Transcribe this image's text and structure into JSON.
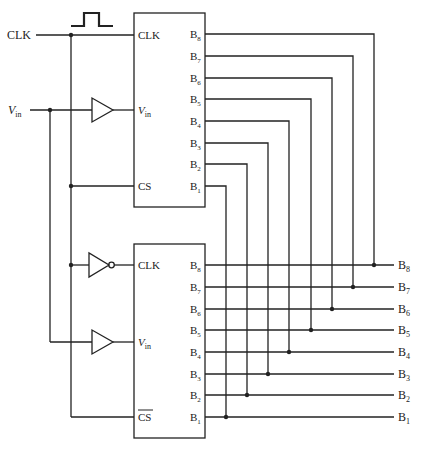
{
  "diagram": {
    "colors": {
      "line": "#222222",
      "background": "#ffffff"
    },
    "inputs": {
      "clk_label": "CLK",
      "vin_label": "V",
      "vin_sub": "in",
      "clock_waveform": "single-pulse"
    },
    "top_adc": {
      "pins_left": {
        "clk": "CLK",
        "vin": "V",
        "vin_sub": "in",
        "cs": "CS"
      },
      "outputs": [
        {
          "b": "B",
          "s": "8"
        },
        {
          "b": "B",
          "s": "7"
        },
        {
          "b": "B",
          "s": "6"
        },
        {
          "b": "B",
          "s": "5"
        },
        {
          "b": "B",
          "s": "4"
        },
        {
          "b": "B",
          "s": "3"
        },
        {
          "b": "B",
          "s": "2"
        },
        {
          "b": "B",
          "s": "1"
        }
      ]
    },
    "bottom_adc": {
      "pins_left": {
        "clk": "CLK",
        "vin": "V",
        "vin_sub": "in",
        "cs": "CS",
        "cs_active_low": true
      },
      "outputs": [
        {
          "b": "B",
          "s": "8"
        },
        {
          "b": "B",
          "s": "7"
        },
        {
          "b": "B",
          "s": "6"
        },
        {
          "b": "B",
          "s": "5"
        },
        {
          "b": "B",
          "s": "4"
        },
        {
          "b": "B",
          "s": "3"
        },
        {
          "b": "B",
          "s": "2"
        },
        {
          "b": "B",
          "s": "1"
        }
      ]
    },
    "bus_outputs": [
      {
        "b": "B",
        "s": "8"
      },
      {
        "b": "B",
        "s": "7"
      },
      {
        "b": "B",
        "s": "6"
      },
      {
        "b": "B",
        "s": "5"
      },
      {
        "b": "B",
        "s": "4"
      },
      {
        "b": "B",
        "s": "3"
      },
      {
        "b": "B",
        "s": "2"
      },
      {
        "b": "B",
        "s": "1"
      }
    ],
    "gates": [
      "buffer (top V_in)",
      "inverter (bottom CLK)",
      "buffer (bottom V_in)"
    ]
  }
}
